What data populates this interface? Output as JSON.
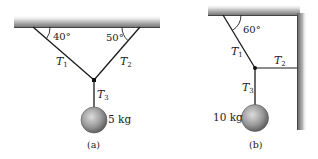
{
  "figure_a": {
    "caption": "(a)",
    "angle_left": "40°",
    "angle_right": "50°",
    "tension_1": "T",
    "tension_1_sub": "1",
    "tension_2": "T",
    "tension_2_sub": "2",
    "tension_3": "T",
    "tension_3_sub": "3",
    "mass_label": "5 kg"
  },
  "figure_b": {
    "caption": "(b)",
    "angle": "60°",
    "tension_1": "T",
    "tension_1_sub": "1",
    "tension_2": "T",
    "tension_2_sub": "2",
    "tension_3": "T",
    "tension_3_sub": "3",
    "mass_label": "10 kg"
  },
  "colors": {
    "rope": "#1a1a1a",
    "ceiling_dark": "#6e6e6e",
    "ceiling_light": "#d9d9d9",
    "ball_dark": "#5a5a5a",
    "ball_light": "#d0d0d0"
  }
}
